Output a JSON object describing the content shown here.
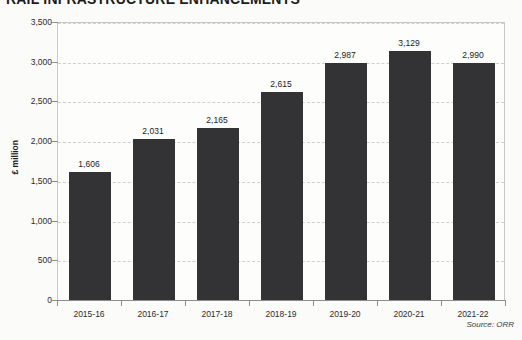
{
  "title": {
    "text": "RAIL INFRASTRUCTURE ENHANCEMENTS"
  },
  "source": {
    "text": "Source: ORR"
  },
  "colors": {
    "bar": "#333336",
    "background": "#fbfbfa",
    "plot_background": "#fdfdfc",
    "gridline": "#cfcfcd",
    "axis": "#8e8e8c",
    "text": "#1b1b1b"
  },
  "chart_data": {
    "type": "bar",
    "title": "RAIL INFRASTRUCTURE ENHANCEMENTS",
    "categories": [
      "2015-16",
      "2016-17",
      "2017-18",
      "2018-19",
      "2019-20",
      "2020-21",
      "2021-22"
    ],
    "values": [
      1606,
      2031,
      2165,
      2615,
      2987,
      3129,
      2990
    ],
    "data_labels": [
      "1,606",
      "2,031",
      "2,165",
      "2,615",
      "2,987",
      "3,129",
      "2,990"
    ],
    "xlabel": "",
    "ylabel": "£ million",
    "ylim": [
      0,
      3500
    ],
    "yticks": [
      0,
      500,
      1000,
      1500,
      2000,
      2500,
      3000,
      3500
    ],
    "ytick_labels": [
      "0",
      "500",
      "1,000",
      "1,500",
      "2,000",
      "2,500",
      "3,000",
      "3,500"
    ],
    "grid": true,
    "grid_style": "dashed-horizontal",
    "legend": "none",
    "series": [
      {
        "name": "Rail infrastructure enhancements",
        "values": [
          1606,
          2031,
          2165,
          2615,
          2987,
          3129,
          2990
        ]
      }
    ]
  }
}
